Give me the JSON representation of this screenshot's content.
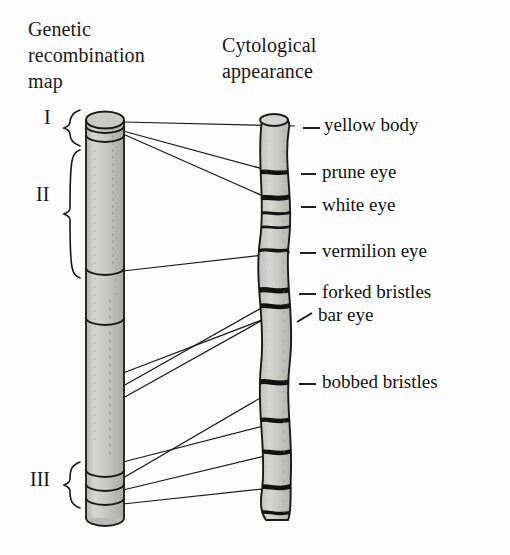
{
  "figure": {
    "background_color": "#fdfdfd",
    "ink_color": "#141414",
    "chromosome_fill": "#c9c9c6",
    "band_color": "#1b1b1b"
  },
  "headings": {
    "left": "Genetic\nrecombination\nmap",
    "right": "Cytological\nappearance"
  },
  "regions": [
    {
      "id": "region-i",
      "label": "I",
      "label_x": 44,
      "label_y": 119,
      "brace_top": 110,
      "brace_bottom": 146
    },
    {
      "id": "region-ii",
      "label": "II",
      "label_x": 36,
      "label_y": 196,
      "brace_top": 150,
      "brace_bottom": 278
    },
    {
      "id": "region-iii",
      "label": "III",
      "label_x": 30,
      "label_y": 481,
      "brace_top": 462,
      "brace_bottom": 508
    }
  ],
  "genes": [
    {
      "id": "yellow-body",
      "name": "yellow body",
      "label_x": 324,
      "label_y": 128,
      "tick_x1": 303,
      "tick_x2": 320,
      "tick_y": 128,
      "tick_slanted": false,
      "map_x": 123,
      "map_y": 122,
      "cyto_x": 295,
      "cyto_y": 126
    },
    {
      "id": "prune-eye",
      "name": "prune eye",
      "label_x": 322,
      "label_y": 175,
      "tick_x1": 301,
      "tick_x2": 316,
      "tick_y": 174,
      "tick_slanted": false,
      "map_x": 123,
      "map_y": 131,
      "cyto_x": 289,
      "cyto_y": 176
    },
    {
      "id": "white-eye",
      "name": "white eye",
      "label_x": 322,
      "label_y": 208,
      "tick_x1": 301,
      "tick_x2": 316,
      "tick_y": 207,
      "tick_slanted": false,
      "map_x": 123,
      "map_y": 134,
      "cyto_x": 288,
      "cyto_y": 207
    },
    {
      "id": "vermilion-eye",
      "name": "vermilion eye",
      "label_x": 322,
      "label_y": 254,
      "tick_x1": 300,
      "tick_x2": 316,
      "tick_y": 253,
      "tick_slanted": false,
      "map_x": 123,
      "map_y": 271,
      "cyto_x": 290,
      "cyto_y": 252
    },
    {
      "id": "forked-bristles",
      "name": "forked bristles",
      "label_x": 322,
      "label_y": 295,
      "tick_x1": 299,
      "tick_x2": 316,
      "tick_y": 294,
      "tick_slanted": false,
      "map_x": 123,
      "map_y": 386,
      "cyto_x": 288,
      "cyto_y": 293
    },
    {
      "id": "bar-eye",
      "name": "bar eye",
      "label_x": 318,
      "label_y": 318,
      "tick_x1": 297,
      "tick_x2": 312,
      "tick_y": 318,
      "tick_slanted": true,
      "map_x": 123,
      "map_y": 398,
      "cyto_x": 286,
      "cyto_y": 307
    },
    {
      "id": "bobbed-bristles",
      "name": "bobbed bristles",
      "label_x": 322,
      "label_y": 385,
      "tick_x1": 299,
      "tick_x2": 316,
      "tick_y": 384,
      "tick_slanted": false,
      "map_x": 123,
      "map_y": 478,
      "cyto_x": 286,
      "cyto_y": 383
    }
  ],
  "extra_connectors": [
    {
      "id": "connector-a",
      "map_x": 123,
      "map_y": 462,
      "cyto_x": 283,
      "cyto_y": 421
    },
    {
      "id": "connector-b",
      "map_x": 123,
      "map_y": 490,
      "cyto_x": 282,
      "cyto_y": 452
    },
    {
      "id": "connector-c",
      "map_x": 123,
      "map_y": 504,
      "cyto_x": 281,
      "cyto_y": 487
    },
    {
      "id": "connector-d",
      "map_x": 123,
      "map_y": 373,
      "cyto_x": 288,
      "cyto_y": 310
    }
  ],
  "genetic_map_chromosome": {
    "id": "genetic-map-chromosome",
    "x": 86,
    "y": 112,
    "width": 38,
    "height": 408,
    "cap_rx": 19,
    "cap_ry": 8,
    "bands": [
      124,
      133,
      268,
      316,
      470,
      484,
      498,
      510
    ]
  },
  "cytological_chromosome": {
    "id": "cytological-chromosome",
    "x": 258,
    "y": 114,
    "width": 34,
    "height": 406,
    "bands": [
      172,
      198,
      214,
      228,
      250,
      290,
      306,
      382,
      420,
      452,
      487,
      512
    ]
  }
}
